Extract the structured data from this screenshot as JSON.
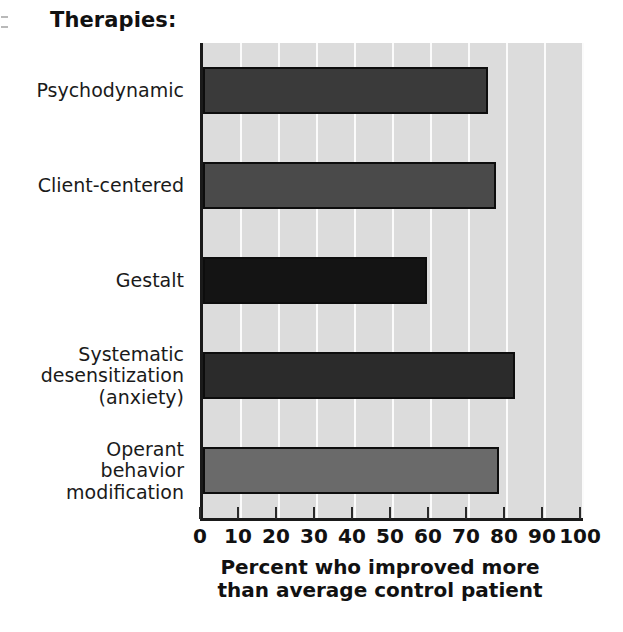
{
  "chart_data": {
    "type": "bar",
    "orientation": "horizontal",
    "title": "Therapies:",
    "xlabel": "Percent who improved more than average control patient",
    "xlabel_lines": [
      "Percent who improved more",
      "than average control patient"
    ],
    "ylabel": "",
    "categories": [
      "Psychodynamic",
      "Client-centered",
      "Gestalt",
      "Systematic desensitization (anxiety)",
      "Operant behavior modification"
    ],
    "category_lines": [
      [
        "Psychodynamic"
      ],
      [
        "Client-centered"
      ],
      [
        "Gestalt"
      ],
      [
        "Systematic",
        "desensitization",
        "(anxiety)"
      ],
      [
        "Operant",
        "behavior",
        "modification"
      ]
    ],
    "values": [
      75,
      77,
      59,
      82,
      78
    ],
    "bar_colors": [
      "#3a3a3a",
      "#4a4a4a",
      "#141414",
      "#2b2b2b",
      "#6a6a6a"
    ],
    "xlim": [
      0,
      100
    ],
    "xticks": [
      0,
      10,
      20,
      30,
      40,
      50,
      60,
      70,
      80,
      90,
      100
    ],
    "xtick_labels": [
      "0",
      "10",
      "20",
      "30",
      "40",
      "50",
      "60",
      "70",
      "80",
      "90",
      "100"
    ],
    "grid": true,
    "grid_axis": "x",
    "grid_color": "#fbfbfb",
    "plot_background": "#dcdcdc",
    "axis_color": "#1a1a1a",
    "legend": null
  }
}
